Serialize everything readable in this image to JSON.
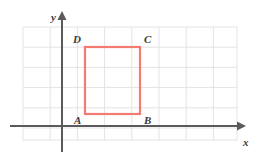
{
  "figure": {
    "width": 265,
    "height": 161,
    "background_color": "#FFFFFF"
  },
  "colors": {
    "grid": "#E3E3E6",
    "axis": "#5A5A5A",
    "shape_stroke": "#F47B72",
    "label_text": "#3B3B3B"
  },
  "grid": {
    "visible": true,
    "x_step": 27.2,
    "y_step": 20.2,
    "x_start": 23,
    "x_end": 237,
    "y_start": 27,
    "y_end": 140,
    "vertical_lines": [
      23,
      50.2,
      77.4,
      104.6,
      131.8,
      159,
      186.2,
      213.4,
      237
    ],
    "vertical_line_count": 9,
    "horizontal_lines": [
      27,
      47.2,
      67.4,
      87.6,
      107.8,
      128,
      140
    ],
    "horizontal_line_count": 6
  },
  "axes": {
    "x_axis": {
      "label": "x",
      "label_x": 243,
      "label_y": 146,
      "y_position": 126,
      "x_from": 10,
      "x_to": 246,
      "arrow": "right"
    },
    "y_axis": {
      "label": "y",
      "label_x": 51,
      "label_y": 21,
      "x_position": 62,
      "y_from": 152,
      "y_to": 11,
      "arrow": "up"
    }
  },
  "shape": {
    "name": "square ABCD",
    "type": "rect",
    "stroke_width": 2.2,
    "left": 85,
    "top": 47,
    "right": 140,
    "bottom": 114,
    "width": 55,
    "height": 67,
    "fill": "none",
    "vertices": [
      {
        "id": "A",
        "label": "A",
        "corner": "bottom-left",
        "px": 85,
        "py": 114,
        "label_x": 74,
        "label_y": 124
      },
      {
        "id": "B",
        "label": "B",
        "corner": "bottom-right",
        "px": 140,
        "py": 114,
        "label_x": 144,
        "label_y": 124
      },
      {
        "id": "C",
        "label": "C",
        "corner": "top-right",
        "px": 140,
        "py": 47,
        "label_x": 144,
        "label_y": 43
      },
      {
        "id": "D",
        "label": "D",
        "corner": "top-left",
        "px": 85,
        "py": 47,
        "label_x": 73,
        "label_y": 43
      }
    ]
  }
}
